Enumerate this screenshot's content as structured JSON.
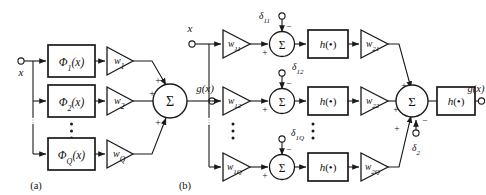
{
  "figure": {
    "background_color": "#ffffff",
    "stroke_color": "#1a1a1a",
    "panels": [
      {
        "caption": "(a)",
        "input_label": "x",
        "output_label": "g(x)",
        "sum_symbol": "Σ",
        "branches": [
          {
            "basis_label": "Φ₁(x)",
            "weight_label": "w₁",
            "sum_sign": "+"
          },
          {
            "basis_label": "Φ₂(x)",
            "weight_label": "w₂",
            "sum_sign": "+"
          },
          {
            "basis_label": "Φ_Q(x)",
            "weight_label": "w_Q",
            "sum_sign": "+"
          }
        ],
        "vertical_ellipsis": "⋮"
      },
      {
        "caption": "(b)",
        "input_label": "x",
        "output_label": "g(x)",
        "sum_symbol": "Σ",
        "activation_label": "h(•)",
        "output_activation_label": "h(•)",
        "output_bias_label": "δ₂",
        "output_bias_sign": "−",
        "output_sum_signs": [
          "+",
          "+",
          "+"
        ],
        "branches": [
          {
            "input_weight_label": "w₁₁",
            "bias_label": "δ₁₁",
            "bias_sign": "−",
            "input_sign": "+",
            "activation_label": "h(•)",
            "output_weight_label": "w₂₁"
          },
          {
            "input_weight_label": "w₁₂",
            "bias_label": "δ₁₂",
            "bias_sign": "−",
            "input_sign": "+",
            "activation_label": "h(•)",
            "output_weight_label": "w₂₂"
          },
          {
            "input_weight_label": "w₁_Q",
            "bias_label": "δ₁_Q",
            "bias_sign": "−",
            "input_sign": "+",
            "activation_label": "h(•)",
            "output_weight_label": "w₂_Q"
          }
        ],
        "vertical_ellipsis": "⋮"
      }
    ]
  },
  "glyphs": {
    "phi": "Φ",
    "sigma": "Σ",
    "delta": "δ",
    "bullet": "•",
    "plus": "+",
    "minus": "−"
  },
  "panel_a": {
    "caption": "(a)",
    "input": "x",
    "output": "g(x)",
    "sum": "Σ",
    "rows": [
      {
        "basis_base": "Φ",
        "basis_sub": "1",
        "basis_arg": "(x)",
        "weight_base": "w",
        "weight_sub": "1",
        "sign": "+"
      },
      {
        "basis_base": "Φ",
        "basis_sub": "2",
        "basis_arg": "(x)",
        "weight_base": "w",
        "weight_sub": "2",
        "sign": "+"
      },
      {
        "basis_base": "Φ",
        "basis_sub": "Q",
        "basis_arg": "(x)",
        "weight_base": "w",
        "weight_sub": "Q",
        "sign": "+"
      }
    ]
  },
  "panel_b": {
    "caption": "(b)",
    "input": "x",
    "output": "g(x)",
    "sum": "Σ",
    "h_base": "h",
    "h_arg": "(•)",
    "out_h_base": "h",
    "out_h_arg": "(•)",
    "out_bias_base": "δ",
    "out_bias_sub": "2",
    "out_bias_sign": "−",
    "rows": [
      {
        "w1_base": "w",
        "w1_sub": "11",
        "bias_base": "δ",
        "bias_sub": "11",
        "bias_sign": "−",
        "in_sign": "+",
        "h_base": "h",
        "h_arg": "(•)",
        "w2_base": "w",
        "w2_sub": "21",
        "out_sign": "+"
      },
      {
        "w1_base": "w",
        "w1_sub": "12",
        "bias_base": "δ",
        "bias_sub": "12",
        "bias_sign": "−",
        "in_sign": "+",
        "h_base": "h",
        "h_arg": "(•)",
        "w2_base": "w",
        "w2_sub": "22",
        "out_sign": "+"
      },
      {
        "w1_base": "w",
        "w1_sub": "1Q",
        "bias_base": "δ",
        "bias_sub": "1Q",
        "bias_sign": "−",
        "in_sign": "+",
        "h_base": "h",
        "h_arg": "(•)",
        "w2_base": "w",
        "w2_sub": "2Q",
        "out_sign": "+"
      }
    ]
  }
}
